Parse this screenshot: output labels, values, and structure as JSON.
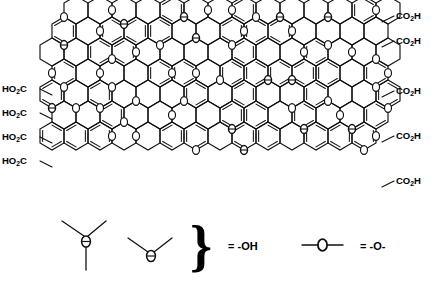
{
  "figure": {
    "background_color": "#ffffff",
    "line_color": "#000000",
    "width": 439,
    "height": 286
  },
  "chart_data": {
    "type": "diagram",
    "lattice": {
      "shape": "hexagonal",
      "orientation": "pointy-top",
      "hex_width": 24,
      "hex_height": 28,
      "columns": 15,
      "rows": 7,
      "origin_x": 52,
      "origin_y": 10
    },
    "legend": [
      {
        "symbol": "trivalent-oxygen-vertex",
        "bonds": 3,
        "meaning": "= -OH"
      },
      {
        "symbol": "divalent-oxygen-vertex",
        "bonds": 2,
        "meaning": "= -OH"
      },
      {
        "symbol": "in-chain-oxygen",
        "bonds": 2,
        "meaning": "= -O-"
      }
    ]
  },
  "edge_labels": {
    "left": [
      {
        "text": "HO",
        "sub": "2",
        "tail": "C",
        "x": 2,
        "y": 92
      },
      {
        "text": "HO",
        "sub": "2",
        "tail": "C",
        "x": 2,
        "y": 116
      },
      {
        "text": "HO",
        "sub": "2",
        "tail": "C",
        "x": 2,
        "y": 140
      },
      {
        "text": "HO",
        "sub": "2",
        "tail": "C",
        "x": 2,
        "y": 164
      }
    ],
    "right": [
      {
        "text": "CO",
        "sub": "2",
        "tail": "H",
        "x": 396,
        "y": 19
      },
      {
        "text": "CO",
        "sub": "2",
        "tail": "H",
        "x": 396,
        "y": 44
      },
      {
        "text": "CO",
        "sub": "2",
        "tail": "H",
        "x": 396,
        "y": 94
      },
      {
        "text": "CO",
        "sub": "2",
        "tail": "H",
        "x": 396,
        "y": 139
      },
      {
        "text": "CO",
        "sub": "2",
        "tail": "H",
        "x": 396,
        "y": 184
      }
    ]
  },
  "legend": {
    "hydroxyl_equals": "= -OH",
    "ether_equals": "= -O-",
    "brace": "}"
  },
  "labels": {
    "left_prefix": "HO",
    "left_sub": "2",
    "left_tail": "C",
    "right_prefix": "CO",
    "right_sub": "2",
    "right_tail": "H"
  }
}
